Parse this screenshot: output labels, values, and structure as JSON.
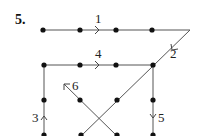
{
  "problem": {
    "number": "5."
  },
  "diagram": {
    "dots": [
      {
        "x": 43,
        "y": 30
      },
      {
        "x": 80,
        "y": 30
      },
      {
        "x": 116,
        "y": 30
      },
      {
        "x": 152,
        "y": 30
      },
      {
        "x": 44,
        "y": 65
      },
      {
        "x": 80,
        "y": 65
      },
      {
        "x": 116,
        "y": 65
      },
      {
        "x": 153,
        "y": 65
      },
      {
        "x": 44,
        "y": 100
      },
      {
        "x": 80,
        "y": 100
      },
      {
        "x": 117,
        "y": 100
      },
      {
        "x": 153,
        "y": 100
      },
      {
        "x": 44,
        "y": 135
      },
      {
        "x": 81,
        "y": 135
      },
      {
        "x": 117,
        "y": 135
      },
      {
        "x": 153,
        "y": 135
      }
    ],
    "strokes": [
      {
        "label": "1",
        "direction": "right"
      },
      {
        "label": "2",
        "direction": "down-left"
      },
      {
        "label": "3",
        "direction": "up"
      },
      {
        "label": "4",
        "direction": "right"
      },
      {
        "label": "5",
        "direction": "down"
      },
      {
        "label": "6",
        "direction": "up-left"
      }
    ]
  }
}
